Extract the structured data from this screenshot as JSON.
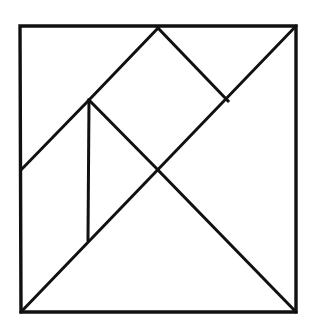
{
  "figure": {
    "kind": "tangram-dissection-diagram",
    "background_color": "#ffffff",
    "line_color": "#111111",
    "line_width": 3,
    "canvas": {
      "width": 314,
      "height": 333
    }
  },
  "chart_data": {
    "type": "diagram",
    "xlabel": "",
    "ylabel": "",
    "xlim": [
      0,
      314
    ],
    "ylim": [
      0,
      333
    ],
    "grid": false,
    "legend": "none",
    "points": {
      "top_left": [
        20,
        26
      ],
      "top_apex": [
        158,
        28
      ],
      "top_right": [
        296,
        26
      ],
      "left_mid": [
        21,
        170
      ],
      "upper_left_node": [
        89,
        100
      ],
      "center": [
        158,
        170
      ],
      "right_notch": [
        228,
        101
      ],
      "vertical_bottom": [
        88,
        240
      ],
      "bottom_left": [
        21,
        312
      ],
      "bottom_right": [
        296,
        312
      ]
    },
    "outline": {
      "name": "square-border",
      "path": "M 20 26 L 296 26 L 296 312 L 21 312 Z"
    },
    "segments": [
      {
        "name": "main-diagonal",
        "from": "top_right",
        "to": "bottom_left",
        "path": "M 296 26 L 21 312"
      },
      {
        "name": "anti-diagonal-lower",
        "from": "center",
        "to": "bottom_right",
        "path": "M 158 170 L 296 312"
      },
      {
        "name": "left-rise-to-apex",
        "from": "left_mid",
        "to": "top_apex",
        "path": "M 21 170 L 89 100 L 158 28"
      },
      {
        "name": "apex-to-notch",
        "from": "top_apex",
        "to": "right_notch",
        "path": "M 158 28 L 228 101"
      },
      {
        "name": "node-to-center",
        "from": "upper_left_node",
        "to": "center",
        "path": "M 89 100 L 158 170"
      },
      {
        "name": "vertical-divider",
        "from": "upper_left_node",
        "to": "vertical_bottom",
        "path": "M 89 100 L 88 240"
      }
    ]
  }
}
